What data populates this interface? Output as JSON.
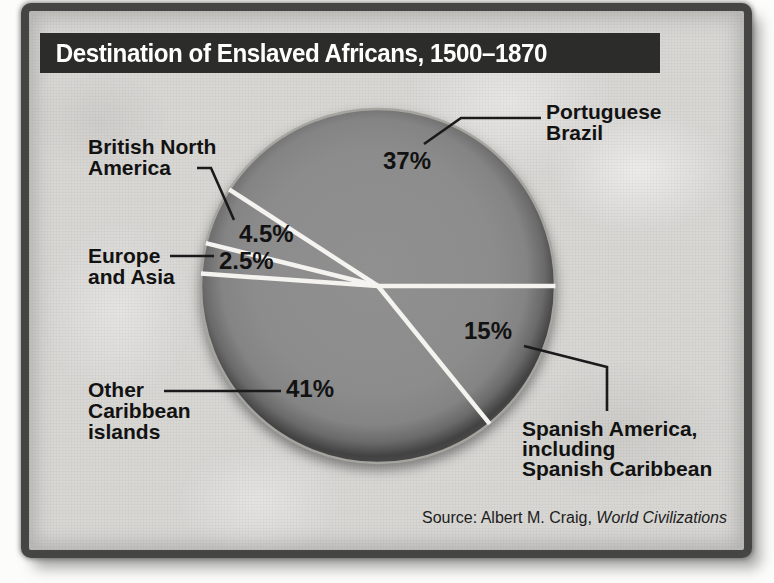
{
  "chart_data": {
    "type": "pie",
    "title": "Destination of Enslaved Africans, 1500–1870",
    "unit": "percent of enslaved Africans by destination",
    "slices": [
      {
        "label": "Portuguese Brazil",
        "value": 37,
        "value_label": "37%",
        "label_lines": [
          "Portuguese",
          "Brazil"
        ]
      },
      {
        "label": "Spanish America, including Spanish Caribbean",
        "value": 15,
        "value_label": "15%",
        "label_lines": [
          "Spanish America,",
          "including",
          "Spanish Caribbean"
        ]
      },
      {
        "label": "Other Caribbean islands",
        "value": 41,
        "value_label": "41%",
        "label_lines": [
          "Other",
          "Caribbean",
          "islands"
        ]
      },
      {
        "label": "Europe and Asia",
        "value": 2.5,
        "value_label": "2.5%",
        "label_lines": [
          "Europe",
          "and Asia"
        ]
      },
      {
        "label": "British North America",
        "value": 4.5,
        "value_label": "4.5%",
        "label_lines": [
          "British North",
          "America"
        ]
      }
    ],
    "source": {
      "prefix": "Source: Albert M. Craig,",
      "work_italic": "World Civilizations"
    },
    "layout_hints": {
      "slice_boundary_angles_deg": [
        0,
        51,
        184,
        194,
        213
      ],
      "note": "angles measured clockwise from the 3 o'clock direction as drawn in the original figure; all slices share one gray fill and are separated by white divider lines",
      "legend": "none; labels placed around pie with leader lines"
    },
    "colors": {
      "slice_fill": "#8c8c8c",
      "slice_rim_dark": "#424242",
      "divider": "#f4f3ef",
      "leader_line": "#1a1a1a",
      "title_bar_bg": "#2c2c2a",
      "title_text": "#ffffff",
      "panel_bg": "#d8d7d4",
      "frame_border": "#454543",
      "label_text": "#121212"
    }
  }
}
